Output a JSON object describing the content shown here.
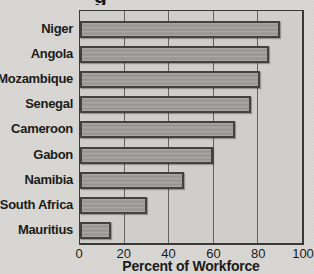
{
  "chart_data": {
    "type": "bar",
    "orientation": "horizontal",
    "cropped_title_fragment": "g",
    "categories": [
      "Niger",
      "Angola",
      "Mozambique",
      "Senegal",
      "Cameroon",
      "Gabon",
      "Namibia",
      "South Africa",
      "Mauritius"
    ],
    "values": [
      90,
      85,
      81,
      77,
      70,
      60,
      47,
      30,
      14
    ],
    "xlabel": "Percent of Workforce",
    "x_ticks": [
      0,
      20,
      40,
      60,
      80,
      100
    ],
    "xlim": [
      0,
      100
    ],
    "grid": true,
    "legend": false
  },
  "colors": {
    "page_bg": "#d8d6d2",
    "plot_bg": "#cfcecb",
    "bar_fill": "#9c9b97",
    "bar_border": "#43423f",
    "grid_line": "#63625f",
    "plot_border": "#3a3936",
    "text": "#1b1b19"
  }
}
